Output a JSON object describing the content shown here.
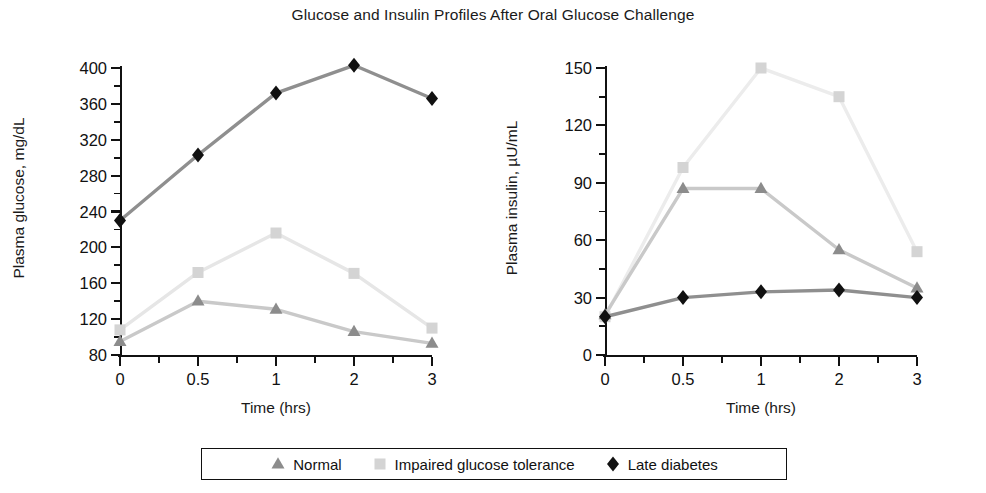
{
  "chart_data": {
    "type": "line",
    "title": "Glucose and Insulin Profiles After Oral Glucose Challenge",
    "panels": [
      {
        "id": "glucose",
        "xlabel": "Time (hrs)",
        "ylabel": "Plasma glucose, mg/dL",
        "categories": [
          "0",
          "0.5",
          "1",
          "2",
          "3"
        ],
        "x": [
          0,
          0.5,
          1,
          2,
          3
        ],
        "ylim": [
          80,
          400
        ],
        "yticks": [
          80,
          120,
          160,
          200,
          240,
          280,
          320,
          360,
          400
        ],
        "ytick_labels": [
          "80",
          "120",
          "160",
          "200",
          "240",
          "280",
          "320",
          "360",
          "400"
        ],
        "minor_ticks": true,
        "grid": false,
        "series": [
          {
            "name": "Normal",
            "marker": "triangle",
            "color": "#8c8c8c",
            "line_color": "#c9c9c9",
            "values": [
              95,
              140,
              131,
              106,
              93
            ]
          },
          {
            "name": "Impaired glucose tolerance",
            "marker": "square",
            "color": "#d4d4d4",
            "line_color": "#e6e6e6",
            "values": [
              108,
              172,
              216,
              171,
              110
            ]
          },
          {
            "name": "Late diabetes",
            "marker": "diamond",
            "color": "#111111",
            "line_color": "#8f8f8f",
            "values": [
              230,
              303,
              372,
              403,
              366
            ]
          }
        ]
      },
      {
        "id": "insulin",
        "xlabel": "Time (hrs)",
        "ylabel": "Plasma insulin, µU/mL",
        "categories": [
          "0",
          "0.5",
          "1",
          "2",
          "3"
        ],
        "x": [
          0,
          0.5,
          1,
          2,
          3
        ],
        "ylim": [
          0,
          150
        ],
        "yticks": [
          0,
          30,
          60,
          90,
          120,
          150
        ],
        "ytick_labels": [
          "0",
          "30",
          "60",
          "90",
          "120",
          "150"
        ],
        "minor_ticks": true,
        "grid": false,
        "series": [
          {
            "name": "Normal",
            "marker": "triangle",
            "color": "#8c8c8c",
            "line_color": "#c9c9c9",
            "values": [
              21,
              87,
              87,
              55,
              35
            ]
          },
          {
            "name": "Impaired glucose tolerance",
            "marker": "square",
            "color": "#d4d4d4",
            "line_color": "#ececec",
            "values": [
              20,
              98,
              150,
              135,
              54
            ]
          },
          {
            "name": "Late diabetes",
            "marker": "diamond",
            "color": "#111111",
            "line_color": "#8f8f8f",
            "values": [
              20,
              30,
              33,
              34,
              30
            ]
          }
        ]
      }
    ],
    "legend": {
      "position": "bottom",
      "entries": [
        {
          "label": "Normal",
          "marker": "triangle",
          "color": "#8c8c8c"
        },
        {
          "label": "Impaired glucose tolerance",
          "marker": "square",
          "color": "#d4d4d4"
        },
        {
          "label": "Late diabetes",
          "marker": "diamond",
          "color": "#111111"
        }
      ]
    }
  }
}
